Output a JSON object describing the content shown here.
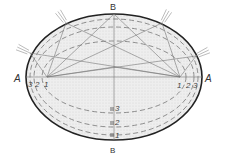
{
  "diagram": {
    "colors": {
      "outline": "#222222",
      "fill": "#ececec",
      "rays": "#777777",
      "dashed": "#666666",
      "text": "#333333"
    },
    "labels": {
      "major_axis_left": "A",
      "major_axis_right": "A",
      "minor_axis_top": "B",
      "minor_axis_bottom": "B"
    },
    "left_focus_numbers": [
      "3",
      "2",
      "1"
    ],
    "right_focus_numbers": [
      "1",
      "2",
      "3"
    ],
    "minor_axis_marks": [
      {
        "label": "3"
      },
      {
        "label": "2"
      },
      {
        "label": "1"
      }
    ]
  }
}
